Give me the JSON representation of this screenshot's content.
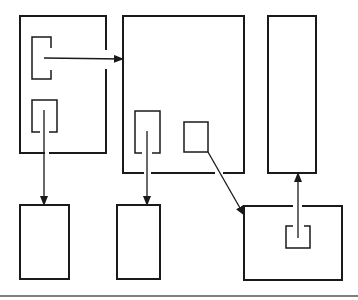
{
  "diagram": {
    "type": "block-diagram",
    "colors": {
      "line": "#1a1a1a",
      "background": "#ffffff",
      "baseline": "#555555"
    },
    "nodes": [
      {
        "id": "outer-left",
        "x": 20,
        "y": 16,
        "w": 86,
        "h": 137
      },
      {
        "id": "outer-middle",
        "x": 123,
        "y": 16,
        "w": 121,
        "h": 157
      },
      {
        "id": "outer-right-tall",
        "x": 268,
        "y": 16,
        "w": 48,
        "h": 157
      },
      {
        "id": "bottom-left",
        "x": 20,
        "y": 205,
        "w": 49,
        "h": 74
      },
      {
        "id": "bottom-middle",
        "x": 117,
        "y": 205,
        "w": 43,
        "h": 74
      },
      {
        "id": "bottom-right",
        "x": 244,
        "y": 206,
        "w": 98,
        "h": 74
      },
      {
        "id": "left-bracket",
        "x": 32,
        "y": 37,
        "w": 19,
        "h": 42
      },
      {
        "id": "left-inner-u",
        "x": 32,
        "y": 100,
        "w": 25,
        "h": 32
      },
      {
        "id": "middle-inner-u",
        "x": 135,
        "y": 111,
        "w": 25,
        "h": 42
      },
      {
        "id": "middle-small-square",
        "x": 184,
        "y": 122,
        "w": 24,
        "h": 30
      },
      {
        "id": "right-inner-u",
        "x": 286,
        "y": 226,
        "w": 24,
        "h": 22
      }
    ],
    "edges": [
      {
        "from": "left-bracket",
        "to": "outer-middle",
        "direction": "right"
      },
      {
        "from": "left-inner-u",
        "to": "bottom-left",
        "direction": "down"
      },
      {
        "from": "middle-inner-u",
        "to": "bottom-middle",
        "direction": "down"
      },
      {
        "from": "middle-small-square",
        "to": "bottom-right",
        "direction": "down-right"
      },
      {
        "from": "right-inner-u",
        "to": "outer-right-tall",
        "direction": "up"
      }
    ]
  }
}
